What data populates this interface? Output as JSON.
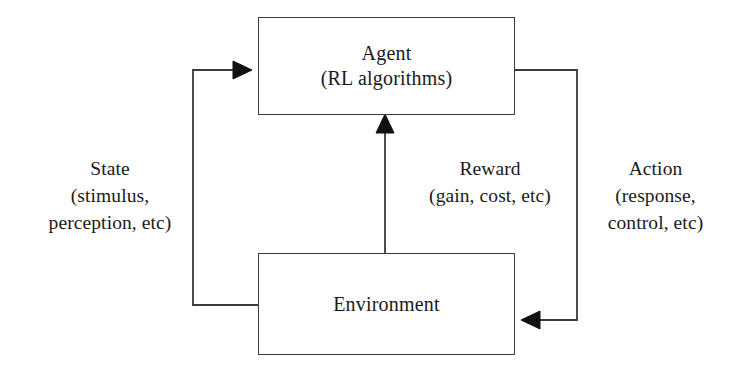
{
  "diagram": {
    "stroke_color": "#3a3a3a",
    "arrow_color": "#111111",
    "background": "#ffffff",
    "nodes": [
      {
        "id": "agent",
        "lines": [
          "Agent",
          "(RL algorithms)"
        ]
      },
      {
        "id": "environment",
        "lines": [
          "Environment"
        ]
      }
    ],
    "edges": [
      {
        "id": "state",
        "lines": [
          "State",
          "(stimulus,",
          "perception, etc)"
        ],
        "from": "environment",
        "to": "agent"
      },
      {
        "id": "reward",
        "lines": [
          "Reward",
          "(gain, cost, etc)"
        ],
        "from": "environment",
        "to": "agent"
      },
      {
        "id": "action",
        "lines": [
          "Action",
          "(response,",
          "control, etc)"
        ],
        "from": "agent",
        "to": "environment"
      }
    ]
  }
}
